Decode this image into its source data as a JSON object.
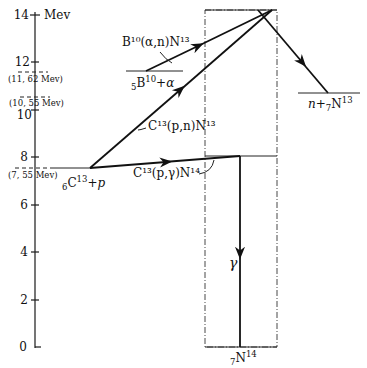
{
  "axis": {
    "unit": "Mev",
    "ticks": [
      "0",
      "2",
      "4",
      "6",
      "8",
      "10",
      "12",
      "14"
    ]
  },
  "levels": {
    "l1162": "(11, 62 Mev)",
    "l1055": "(10, 55 Mev)",
    "l755": "(7, 55 Mev)"
  },
  "labels": {
    "c13p_sub": "6",
    "c13p_main": "C",
    "c13p_sup": "13",
    "c13p_tail": "+p",
    "b10a_sub": "5",
    "b10a_main": "B",
    "b10a_sup": "10",
    "b10a_tail": "+α",
    "b10_reaction": "B¹⁰(α,n)N¹³",
    "c13pn_reaction": "C¹³(p,n)N¹³",
    "c13pg_reaction": "C¹³(p,γ)N¹⁴",
    "gamma": "γ",
    "nn13_head": "n+",
    "nn13_sub": "7",
    "nn13_main": "N",
    "nn13_sup": "13",
    "n14_sub": "7",
    "n14_main": "N",
    "n14_sup": "14"
  }
}
